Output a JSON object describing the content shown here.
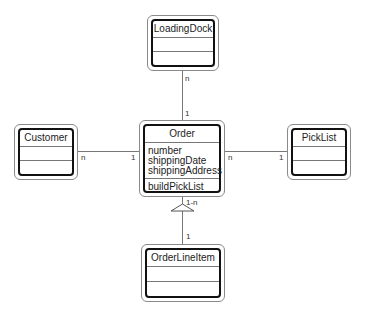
{
  "diagram": {
    "type": "UML class diagram",
    "classes": {
      "loading_dock": {
        "name": "LoadingDock",
        "attributes": [],
        "operations": []
      },
      "order": {
        "name": "Order",
        "attributes": [
          "number",
          "shippingDate",
          "shippingAddress"
        ],
        "operations": [
          "buildPickList"
        ]
      },
      "customer": {
        "name": "Customer",
        "attributes": [],
        "operations": []
      },
      "pick_list": {
        "name": "PickList",
        "attributes": [],
        "operations": []
      },
      "order_line_item": {
        "name": "OrderLineItem",
        "attributes": [],
        "operations": []
      }
    },
    "associations": {
      "loading_dock_order": {
        "from": "LoadingDock",
        "to": "Order",
        "from_mult": "n",
        "to_mult": "1"
      },
      "customer_order": {
        "from": "Customer",
        "to": "Order",
        "from_mult": "n",
        "to_mult": "1"
      },
      "order_pick_list": {
        "from": "Order",
        "to": "PickList",
        "from_mult": "n",
        "to_mult": "1"
      },
      "order_line_item": {
        "from": "Order",
        "to": "OrderLineItem",
        "from_mult": "1-n",
        "to_mult": "1",
        "kind": "aggregation-triangle"
      }
    }
  }
}
